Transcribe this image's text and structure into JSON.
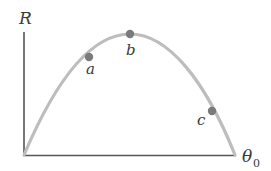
{
  "diagram": {
    "type": "range-vs-launch-angle",
    "y_axis_label": "R",
    "x_axis_label": "θ",
    "x_axis_subscript": "0",
    "points": [
      {
        "label": "a"
      },
      {
        "label": "b"
      },
      {
        "label": "c"
      }
    ],
    "colors": {
      "axis": "#555555",
      "curve": "#bdbdbd",
      "point": "#7a7a7a",
      "text": "#3a3a3a"
    }
  }
}
